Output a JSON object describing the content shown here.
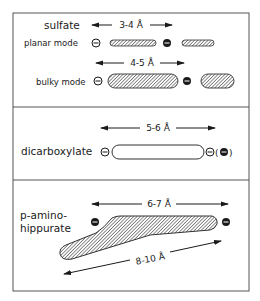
{
  "colors": {
    "ink": "#1a1a1a",
    "border": "#555555",
    "background": "#ffffff",
    "hatch": "#333333"
  },
  "panels": [
    {
      "id": "sulfate",
      "title": "sulfate",
      "dimension_top": "3-4 Å",
      "rows": [
        {
          "label": "planar mode",
          "charge_left": "⊖",
          "charge_mid": "●",
          "shape": "thin hatched rod"
        },
        {
          "label": "bulky mode",
          "dimension": "4-5 Å",
          "charge_left": "⊖",
          "charge_mid": "●",
          "shape": "thick hatched rod"
        }
      ]
    },
    {
      "id": "dicarboxylate",
      "title": "dicarboxylate",
      "dimension_top": "5-6 Å",
      "charge_left": "⊖",
      "charge_right": "⊖(●)",
      "shape": "open rod"
    },
    {
      "id": "p-aminohippurate",
      "title_line1": "p-amino-",
      "title_line2": "hippurate",
      "dimension_top": "6-7 Å",
      "dimension_diagonal": "8-10 Å",
      "charge_left": "●",
      "charge_right": "●",
      "shape": "hatched wedge"
    }
  ]
}
